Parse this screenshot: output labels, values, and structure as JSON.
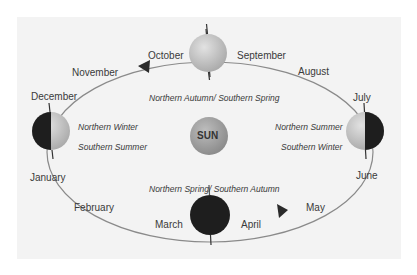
{
  "diagram": {
    "center_label": "SUN",
    "months": [
      {
        "name": "October"
      },
      {
        "name": "September"
      },
      {
        "name": "November"
      },
      {
        "name": "August"
      },
      {
        "name": "December"
      },
      {
        "name": "July"
      },
      {
        "name": "January"
      },
      {
        "name": "June"
      },
      {
        "name": "February"
      },
      {
        "name": "May"
      },
      {
        "name": "March"
      },
      {
        "name": "April"
      }
    ],
    "seasons": {
      "top": "Northern Autumn/ Southern Spring",
      "bottom": "Northern Spring/ Southern Autumn",
      "left_1": "Northern Winter",
      "left_2": "Southern Summer",
      "right_1": "Northern Summer",
      "right_2": "Southern Winter"
    },
    "colors": {
      "background": "#ffffff",
      "panel": "#f3f3f3",
      "orbit": "#8a8a8a",
      "sun": "#9c9c9c",
      "earth_lit": "#c8c8c8",
      "earth_dark": "#1e1e1e",
      "text": "#3a3a3a"
    },
    "earth_positions": [
      {
        "position": "top",
        "phase": "fully-lit"
      },
      {
        "position": "left",
        "phase": "left-half-dark"
      },
      {
        "position": "right",
        "phase": "right-half-dark"
      },
      {
        "position": "bottom",
        "phase": "fully-dark"
      }
    ],
    "orbit_direction": "counter-clockwise"
  }
}
